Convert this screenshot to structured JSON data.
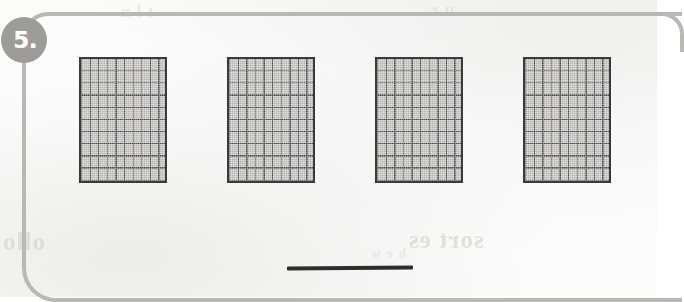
{
  "worksheet": {
    "problem_number": "5.",
    "badge_color": "#9d9c98",
    "rule_color": "#b9b8b4",
    "page_background": "#fdfdfc"
  },
  "models": {
    "kind": "hundred-square-flat",
    "count": 4,
    "rows_per_model": 10,
    "columns_per_model": 10,
    "squares_per_model": 100,
    "total_squares": 400,
    "fill_color": "#b6b5b2",
    "line_color": "#4a4a4a",
    "border_color": "#3a3a3a",
    "items": [
      {
        "label": "hundred-square-model-1",
        "value": "100"
      },
      {
        "label": "hundred-square-model-2",
        "value": "100"
      },
      {
        "label": "hundred-square-model-3",
        "value": "100"
      },
      {
        "label": "hundred-square-model-4",
        "value": "100"
      }
    ]
  },
  "answer": {
    "value": "",
    "placeholder": "",
    "line_color": "#2e2e2e"
  },
  "bleed_through": {
    "left_text": "ollo",
    "right_text": "sort es",
    "top_left_text": "t l n",
    "top_right_text": "u r",
    "mid_text": "h e w"
  }
}
